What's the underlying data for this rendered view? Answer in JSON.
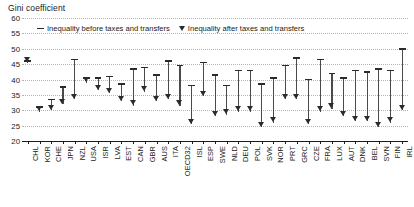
{
  "chart_data": {
    "type": "bar",
    "title": "Gini coefficient",
    "xlabel": "",
    "ylabel": "Gini coefficient",
    "ylim": [
      20,
      60
    ],
    "yticks": [
      60,
      55,
      50,
      45,
      40,
      35,
      30,
      25,
      20
    ],
    "grid": true,
    "legend_position": "top",
    "legend": [
      {
        "glyph": "bar",
        "label": "Inequality before taxes and transfers"
      },
      {
        "glyph": "triangle-down",
        "label": "Inequality after taxes and transfers"
      }
    ],
    "categories": [
      "CHL",
      "KOR",
      "CHE",
      "JPN",
      "NZL",
      "USA",
      "ISR",
      "LVA",
      "EST",
      "CAN",
      "GBR",
      "AUS",
      "ITA",
      "OECD32",
      "ISL",
      "ESP",
      "SWE",
      "NLD",
      "DEU",
      "POL",
      "SVK",
      "NOR",
      "PRT",
      "GRC",
      "CZE",
      "FRA",
      "LUX",
      "AUT",
      "DNK",
      "BEL",
      "SVN",
      "FIN",
      "IRL"
    ],
    "series": [
      {
        "name": "Inequality before taxes and transfers",
        "glyph": "bar",
        "values": [
          46.0,
          31.0,
          33.5,
          37.5,
          46.5,
          40.5,
          40.5,
          41.0,
          38.5,
          43.5,
          44.0,
          41.5,
          46.0,
          44.5,
          38.0,
          45.5,
          41.5,
          38.0,
          43.0,
          43.0,
          38.5,
          40.5,
          44.5,
          47.0,
          40.0,
          46.5,
          42.0,
          40.5,
          43.0,
          42.5,
          43.5,
          43.0,
          50.0
        ]
      },
      {
        "name": "Inequality after taxes and transfers",
        "glyph": "triangle-down",
        "values": [
          45.5,
          29.5,
          30.0,
          32.0,
          33.5,
          39.0,
          36.5,
          35.5,
          33.0,
          31.5,
          36.0,
          33.0,
          33.5,
          31.5,
          25.5,
          34.5,
          28.0,
          28.5,
          29.5,
          29.5,
          24.5,
          26.0,
          33.5,
          33.5,
          25.5,
          29.5,
          30.5,
          28.0,
          26.5,
          26.5,
          24.5,
          26.0,
          30.0
        ]
      }
    ]
  }
}
